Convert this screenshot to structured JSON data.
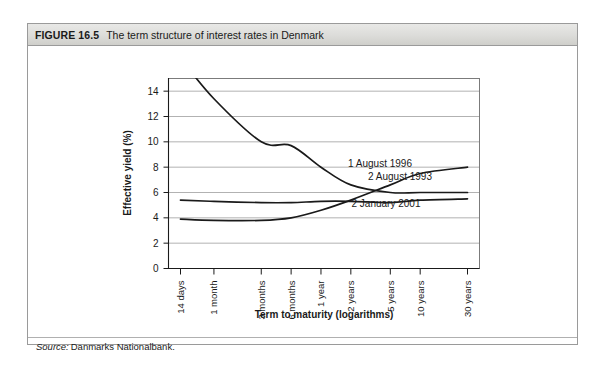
{
  "figure": {
    "number": "FIGURE 16.5",
    "title": "The term structure of interest rates in Denmark",
    "source_label": "Source:",
    "source_value": "Danmarks Nationalbank."
  },
  "chart_data": {
    "type": "line",
    "title": "The term structure of interest rates in Denmark",
    "xlabel": "Term to maturity (logarithms)",
    "ylabel": "Effective yield (%)",
    "categories": [
      "14 days",
      "1 month",
      "3 months",
      "6 months",
      "1 year",
      "2 years",
      "5 years",
      "10 years",
      "30 years"
    ],
    "ylim": [
      0,
      15
    ],
    "yticks": [
      0,
      2,
      4,
      6,
      8,
      10,
      12,
      14
    ],
    "grid": true,
    "legend": "inline-annotations",
    "series": [
      {
        "name": "2 August 1993",
        "values": [
          16.6,
          13.4,
          10.0,
          9.7,
          8.0,
          6.6,
          6.0,
          6.0,
          6.0
        ]
      },
      {
        "name": "1 August 1996",
        "values": [
          3.9,
          3.8,
          3.8,
          4.0,
          4.6,
          5.4,
          6.6,
          7.5,
          8.0
        ]
      },
      {
        "name": "2 January 2001",
        "values": [
          5.4,
          5.3,
          5.2,
          5.2,
          5.3,
          5.3,
          5.2,
          5.4,
          5.5
        ]
      }
    ],
    "annotations": [
      {
        "text": "1 August 1996",
        "value": 8.0
      },
      {
        "text": "2 August 1993",
        "value": 6.9
      },
      {
        "text": "2 January 2001",
        "value": 4.9
      }
    ]
  },
  "colors": {
    "curve": "#1a1a1a",
    "grid": "#9e9e9e",
    "frame": "#6e6e6e",
    "header_bg": "#dcdcd9"
  }
}
